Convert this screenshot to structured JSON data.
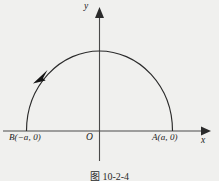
{
  "figure": {
    "caption": "图 10-2-4",
    "axes": {
      "x_label": "x",
      "y_label": "y",
      "origin_label": "O"
    },
    "points": [
      {
        "name": "B",
        "label": "B(−a, 0)",
        "coords": "(−a, 0)"
      },
      {
        "name": "A",
        "label": "A(a, 0)",
        "coords": "(a, 0)"
      }
    ],
    "curve": {
      "name": "upper-semicircle",
      "description": "semicircular arc of radius a above the x-axis from A(a,0) to B(-a,0)",
      "direction": "counterclockwise",
      "direction_marker": "arrowhead on upper-left of arc"
    },
    "colors": {
      "background": "#f0f0ee",
      "ink": "#2b2b2b",
      "axis": "#4a4a4a"
    }
  }
}
